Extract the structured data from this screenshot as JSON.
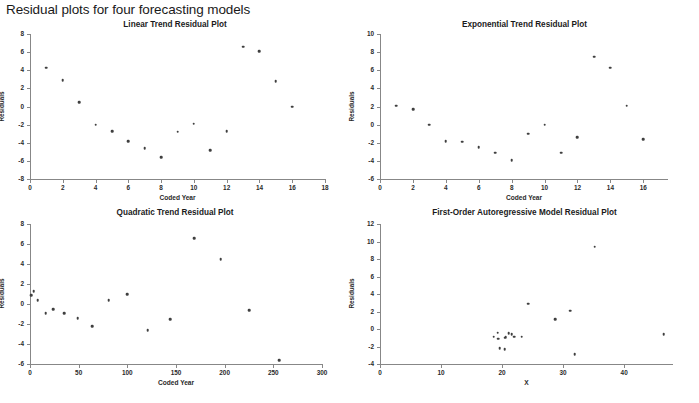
{
  "page": {
    "title": "Residual plots for four forecasting models"
  },
  "panels": [
    {
      "title": "Linear Trend Residual Plot"
    },
    {
      "title": "Exponential Trend Residual Plot"
    },
    {
      "title": "Quadratic Trend Residual Plot"
    },
    {
      "title": "First-Order Autoregressive Model Residual Plot"
    }
  ],
  "chart_data": [
    {
      "type": "scatter",
      "title": "Linear Trend Residual Plot",
      "xlabel": "Coded Year",
      "ylabel": "Residuals",
      "xlim": [
        0,
        18
      ],
      "ylim": [
        -8,
        8
      ],
      "xticks": [
        0,
        2,
        4,
        6,
        8,
        10,
        12,
        14,
        16,
        18
      ],
      "xticklabels": [
        "0",
        "2",
        "4",
        "6",
        "8",
        "10",
        "12",
        "14",
        "16",
        "18"
      ],
      "yticks": [
        -8,
        -6,
        -4,
        -2,
        0,
        2,
        4,
        6,
        8
      ],
      "yticklabels": [
        "-8",
        "-6",
        "-4",
        "-2",
        "0",
        "2",
        "4",
        "6",
        "8"
      ],
      "grid": false,
      "legend": false,
      "x": [
        1,
        2,
        3,
        4,
        5,
        6,
        7,
        8,
        9,
        10,
        11,
        12,
        13,
        14,
        15,
        16
      ],
      "y": [
        4.3,
        2.9,
        0.5,
        -2.0,
        -2.7,
        -3.8,
        -4.6,
        -5.6,
        -2.8,
        -1.9,
        -4.8,
        -2.7,
        6.6,
        6.1,
        2.8,
        0.0
      ]
    },
    {
      "type": "scatter",
      "title": "Exponential Trend Residual Plot",
      "xlabel": "Coded Year",
      "ylabel": "Residuals",
      "xlim": [
        0,
        17.5
      ],
      "ylim": [
        -6,
        10
      ],
      "xticks": [
        0,
        2,
        4,
        6,
        8,
        10,
        12,
        14,
        16
      ],
      "xticklabels": [
        "0",
        "2",
        "4",
        "6",
        "8",
        "10",
        "12",
        "14",
        "16"
      ],
      "yticks": [
        -6,
        -4,
        -2,
        0,
        2,
        4,
        6,
        8,
        10
      ],
      "yticklabels": [
        "-6",
        "-4",
        "-2",
        "0",
        "2",
        "4",
        "6",
        "8",
        "10"
      ],
      "grid": false,
      "legend": false,
      "x": [
        1,
        2,
        3,
        4,
        5,
        6,
        7,
        8,
        9,
        10,
        11,
        12,
        13,
        14,
        15,
        16
      ],
      "y": [
        2.1,
        1.7,
        0.0,
        -1.8,
        -1.9,
        -2.5,
        -3.1,
        -3.9,
        -1.0,
        0.0,
        -3.1,
        -1.4,
        7.5,
        6.3,
        2.1,
        -1.6
      ]
    },
    {
      "type": "scatter",
      "title": "Quadratic Trend Residual Plot",
      "xlabel": "Coded Year",
      "ylabel": "Residuals",
      "xlim": [
        0,
        300
      ],
      "ylim": [
        -6,
        8
      ],
      "xticks": [
        0,
        50,
        100,
        150,
        200,
        250,
        300
      ],
      "xticklabels": [
        "0",
        "50",
        "100",
        "150",
        "200",
        "250",
        "300"
      ],
      "yticks": [
        -6,
        -4,
        -2,
        0,
        2,
        4,
        6,
        8
      ],
      "yticklabels": [
        "-6",
        "-4",
        "-2",
        "0",
        "2",
        "4",
        "6",
        "8"
      ],
      "grid": false,
      "legend": false,
      "x": [
        1,
        4,
        8,
        16,
        24,
        35,
        49,
        64,
        81,
        100,
        121,
        144,
        169,
        196,
        225,
        256
      ],
      "y": [
        0.9,
        1.3,
        0.4,
        -0.9,
        -0.5,
        -0.9,
        -1.4,
        -2.2,
        0.4,
        1.0,
        -2.6,
        -1.5,
        6.6,
        4.5,
        -0.6,
        -5.6
      ]
    },
    {
      "type": "scatter",
      "title": "First-Order Autoregressive Model Residual Plot",
      "xlabel": "X",
      "ylabel": "Residuals",
      "xlim": [
        0,
        48
      ],
      "ylim": [
        -4,
        12
      ],
      "xticks": [
        0,
        10,
        20,
        30,
        40
      ],
      "xticklabels": [
        "0",
        "10",
        "20",
        "30",
        "40"
      ],
      "yticks": [
        -4,
        -2,
        0,
        2,
        4,
        6,
        8,
        10,
        12
      ],
      "yticklabels": [
        "-4",
        "-2",
        "0",
        "2",
        "4",
        "6",
        "8",
        "10",
        "12"
      ],
      "grid": false,
      "legend": false,
      "x": [
        18.6,
        19.3,
        19.4,
        19.6,
        20.4,
        20.5,
        20.6,
        21.1,
        21.6,
        22.0,
        23.2,
        24.3,
        28.7,
        31.2,
        31.9,
        35.2,
        46.5
      ],
      "y": [
        -0.9,
        -0.4,
        -1.1,
        -2.2,
        -2.3,
        -1.0,
        -0.9,
        -0.5,
        -0.6,
        -0.9,
        -0.9,
        2.9,
        1.1,
        2.1,
        -2.9,
        9.4,
        -0.6
      ]
    }
  ]
}
